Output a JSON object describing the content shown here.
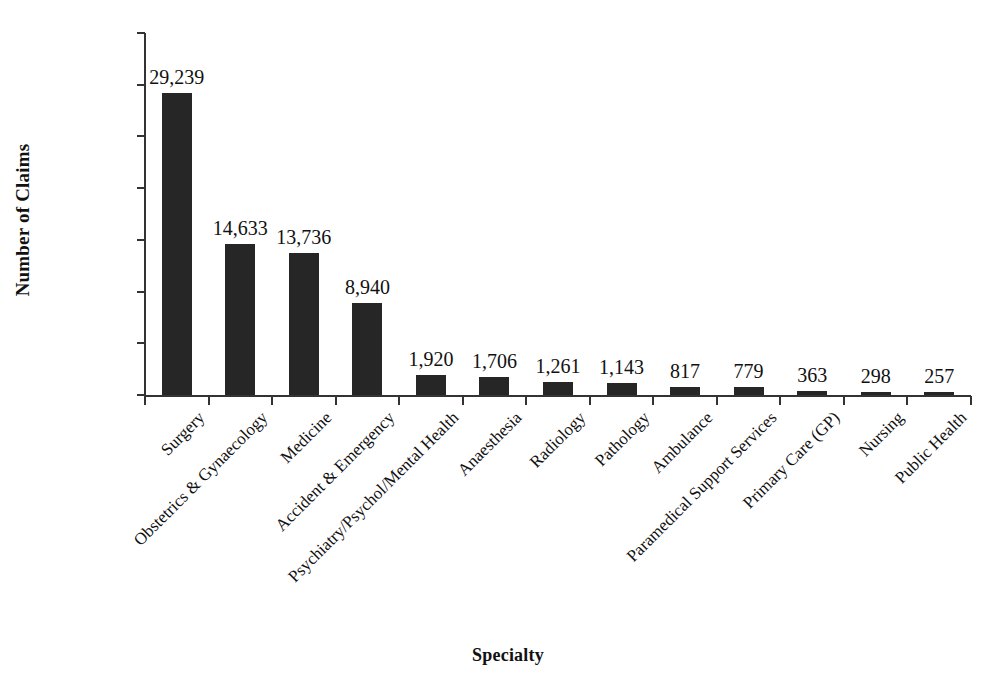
{
  "chart_data": {
    "type": "bar",
    "title": "",
    "xlabel": "Specialty",
    "ylabel": "Number of Claims",
    "categories": [
      "Surgery",
      "Obstetrics & Gynaecology",
      "Medicine",
      "Accident & Emergency",
      "Psychiatry/Psychol/Mental Health",
      "Anaesthesia",
      "Radiology",
      "Pathology",
      "Ambulance",
      "Paramedical Support Services",
      "Primary Care (GP)",
      "Nursing",
      "Public Health"
    ],
    "values": [
      29239,
      14633,
      13736,
      8940,
      1920,
      1706,
      1261,
      1143,
      817,
      779,
      363,
      298,
      257
    ],
    "value_labels": [
      "29,239",
      "14,633",
      "13,736",
      "8,940",
      "1,920",
      "1,706",
      "1,261",
      "1,143",
      "817",
      "779",
      "363",
      "298",
      "257"
    ],
    "ylim": [
      0,
      35000
    ],
    "yticks": [
      0,
      5000,
      10000,
      15000,
      20000,
      25000,
      30000,
      35000
    ],
    "ytick_labels": [
      "0",
      "5,000",
      "10,000",
      "15,000",
      "20,000",
      "25,000",
      "30,000",
      "35,000"
    ],
    "grid": false,
    "legend": null,
    "bar_color": "#262626",
    "axis_color": "#333333",
    "background_color": "#ffffff",
    "xlabel_rotation_deg": -45
  },
  "axes": {
    "y_title": "Number of Claims",
    "x_title": "Specialty"
  }
}
